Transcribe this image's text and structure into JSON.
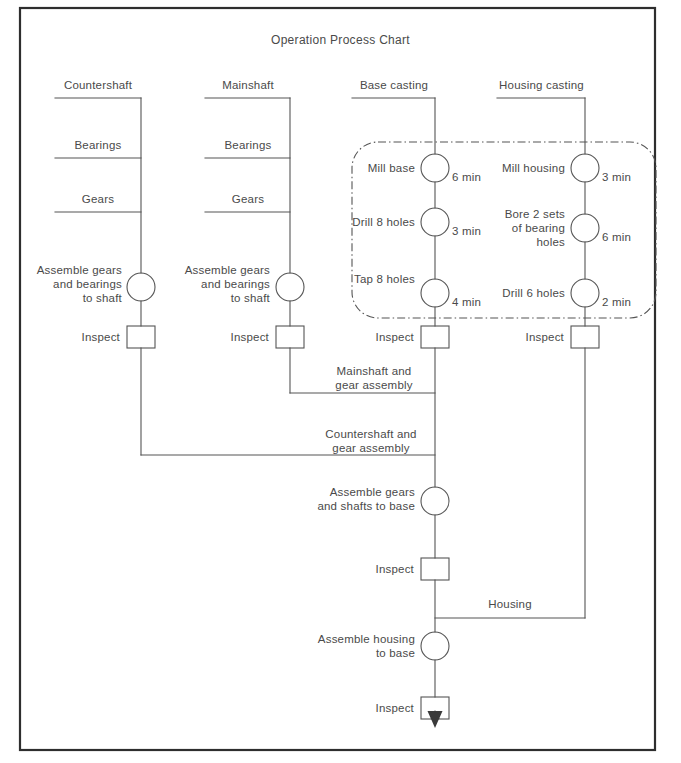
{
  "page": {
    "title": "Operation Process Chart",
    "frame_color": "#2e2e2e",
    "line_color": "#555555",
    "text_color": "#4a4a4a",
    "dashed_box_color": "#555555"
  },
  "columns": [
    {
      "id": "countershaft",
      "header": "Countershaft",
      "materials": [
        "Bearings",
        "Gears"
      ],
      "operations": [
        {
          "label": "Assemble gears\nand bearings\nto shaft",
          "time": "",
          "shape": "circle"
        }
      ],
      "inspect_label": "Inspect"
    },
    {
      "id": "mainshaft",
      "header": "Mainshaft",
      "materials": [
        "Bearings",
        "Gears"
      ],
      "operations": [
        {
          "label": "Assemble gears\nand bearings\nto shaft",
          "time": "",
          "shape": "circle"
        }
      ],
      "inspect_label": "Inspect"
    },
    {
      "id": "base-casting",
      "header": "Base casting",
      "materials": [],
      "operations": [
        {
          "label": "Mill base",
          "time": "6 min",
          "shape": "circle"
        },
        {
          "label": "Drill 8 holes",
          "time": "3 min",
          "shape": "circle"
        },
        {
          "label": "Tap 8 holes",
          "time": "4 min",
          "shape": "circle"
        }
      ],
      "inspect_label": "Inspect"
    },
    {
      "id": "housing-casting",
      "header": "Housing casting",
      "materials": [],
      "operations": [
        {
          "label": "Mill housing",
          "time": "3 min",
          "shape": "circle"
        },
        {
          "label": "Bore 2 sets\nof bearing\nholes",
          "time": "6 min",
          "shape": "circle"
        },
        {
          "label": "Drill 6 holes",
          "time": "2 min",
          "shape": "circle"
        }
      ],
      "inspect_label": "Inspect"
    }
  ],
  "merge_labels": {
    "mainshaft": "Mainshaft and\ngear assembly",
    "countershaft": "Countershaft and\ngear assembly",
    "housing": "Housing"
  },
  "assembly": {
    "gears_shafts_to_base": "Assemble gears\nand shafts to base",
    "inspect_1": "Inspect",
    "housing_to_base": "Assemble housing\nto base",
    "inspect_2": "Inspect"
  }
}
